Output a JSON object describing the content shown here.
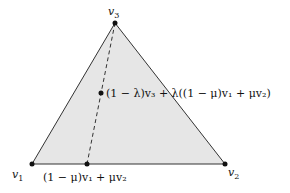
{
  "diagram": {
    "fill_color": "#e6e6e6",
    "stroke_color": "#333333",
    "vertices": {
      "v1": {
        "label": "v",
        "sub": "1",
        "x": 32,
        "y": 164
      },
      "v2": {
        "label": "v",
        "sub": "2",
        "x": 225,
        "y": 164
      },
      "v3": {
        "label": "v",
        "sub": "3",
        "x": 115,
        "y": 23
      }
    },
    "edge_point": {
      "label": "(1 − μ)v₁ + μv₂",
      "x": 87,
      "y": 164
    },
    "interior_point": {
      "label": "(1 − λ)v₃ + λ((1 − μ)v₁ + μv₂)",
      "x": 101,
      "y": 93
    }
  }
}
